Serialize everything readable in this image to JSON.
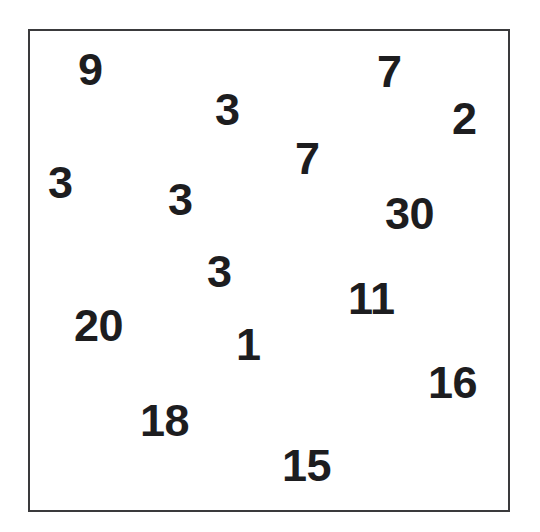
{
  "figure": {
    "title": "",
    "background_color": "#ffffff",
    "frame": {
      "border_color": "#3a3a3c",
      "border_width_px": 2,
      "left_px": 28,
      "top_px": 29,
      "width_px": 482,
      "height_px": 483
    },
    "text_color": "#1d1d1f"
  },
  "chart_data": {
    "type": "scatter",
    "title": "",
    "subtitle": "",
    "xlabel": "",
    "ylabel": "",
    "xlim": [
      0,
      540
    ],
    "ylim": [
      0,
      532
    ],
    "grid": false,
    "legend": null,
    "axis_ticks": {
      "x": [],
      "y": []
    },
    "marker_style": "text-number",
    "note": "Each data point is rendered as its numeric value in bold text at its scatter position; pixel coordinates are the glyph top-left within the 540x532 image.",
    "points": [
      {
        "label": "9",
        "value": 9,
        "x": 78,
        "y": 56
      },
      {
        "label": "3",
        "value": 3,
        "x": 215,
        "y": 96
      },
      {
        "label": "7",
        "value": 7,
        "x": 377,
        "y": 58
      },
      {
        "label": "2",
        "value": 2,
        "x": 452,
        "y": 105
      },
      {
        "label": "3",
        "value": 3,
        "x": 48,
        "y": 169
      },
      {
        "label": "7",
        "value": 7,
        "x": 295,
        "y": 145
      },
      {
        "label": "3",
        "value": 3,
        "x": 168,
        "y": 186
      },
      {
        "label": "30",
        "value": 30,
        "x": 385,
        "y": 200
      },
      {
        "label": "3",
        "value": 3,
        "x": 207,
        "y": 258
      },
      {
        "label": "11",
        "value": 11,
        "x": 348,
        "y": 285
      },
      {
        "label": "20",
        "value": 20,
        "x": 74,
        "y": 312
      },
      {
        "label": "1",
        "value": 1,
        "x": 236,
        "y": 331
      },
      {
        "label": "16",
        "value": 16,
        "x": 428,
        "y": 369
      },
      {
        "label": "18",
        "value": 18,
        "x": 140,
        "y": 407
      },
      {
        "label": "15",
        "value": 15,
        "x": 282,
        "y": 452
      }
    ],
    "values": [
      9,
      3,
      7,
      2,
      3,
      7,
      3,
      30,
      3,
      11,
      20,
      1,
      16,
      18,
      15
    ],
    "count": 15
  }
}
